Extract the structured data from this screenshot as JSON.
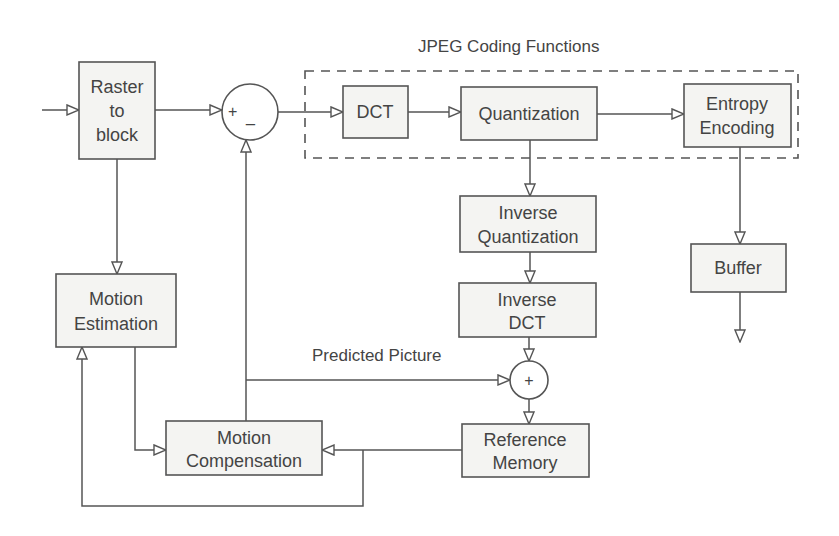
{
  "diagram": {
    "group_label": "JPEG Coding Functions",
    "blocks": {
      "raster": [
        "Raster",
        "to",
        "block"
      ],
      "dct": [
        "DCT"
      ],
      "quant": [
        "Quantization"
      ],
      "entropy": [
        "Entropy",
        "Encoding"
      ],
      "iquant": [
        "Inverse",
        "Quantization"
      ],
      "idct": [
        "Inverse",
        "DCT"
      ],
      "buffer": [
        "Buffer"
      ],
      "motion_est": [
        "Motion",
        "Estimation"
      ],
      "motion_comp": [
        "Motion",
        "Compensation"
      ],
      "ref_mem": [
        "Reference",
        "Memory"
      ]
    },
    "subtractor": {
      "plus": "+",
      "minus": "_"
    },
    "adder": {
      "plus": "+"
    },
    "edge_labels": {
      "predicted": "Predicted Picture"
    }
  }
}
